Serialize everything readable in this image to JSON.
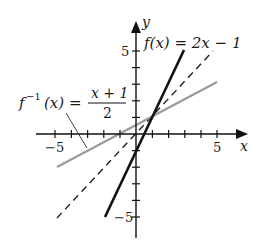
{
  "axes": {
    "x_label": "x",
    "y_label": "y",
    "x_tick_labels": {
      "neg": "−5",
      "pos": "5"
    },
    "y_tick_labels": {
      "pos": "5",
      "neg": "−5"
    },
    "x_range": [
      -5,
      5
    ],
    "y_range": [
      -5,
      5
    ]
  },
  "curves": {
    "f": {
      "label_lhs": "f(x) = 2x − 1",
      "equation": "2x - 1",
      "color": "#111111",
      "style": "solid",
      "domain": [
        -2,
        3
      ]
    },
    "f_inverse": {
      "label_f": "f",
      "label_sup": "−1",
      "label_arg": "(x) =",
      "numerator": "x + 1",
      "denominator": "2",
      "equation": "(x + 1)/2",
      "color": "#9a9a9a",
      "style": "solid",
      "domain": [
        -5,
        5
      ]
    },
    "identity": {
      "equation": "x",
      "color": "#222222",
      "style": "dashed",
      "domain": [
        -5,
        5
      ]
    }
  }
}
